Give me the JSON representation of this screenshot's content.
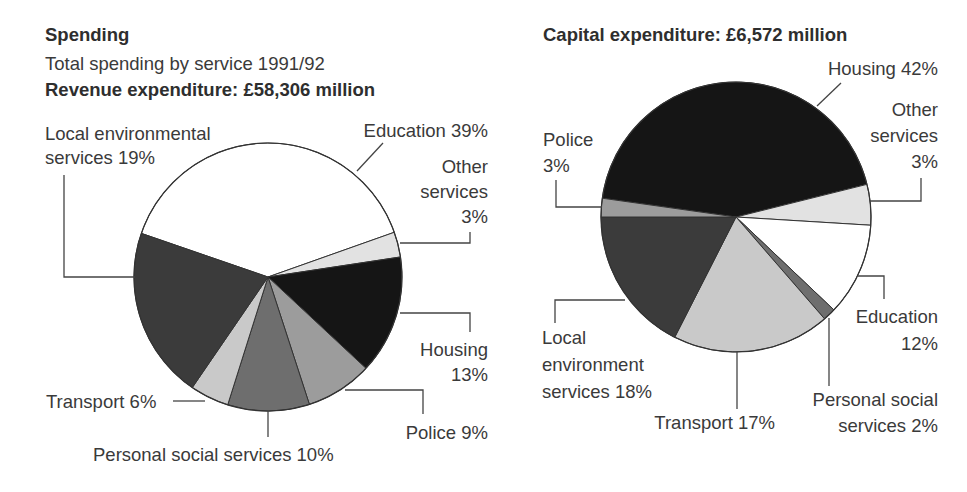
{
  "header": {
    "title": "Spending",
    "subtitle": "Total spending by service 1991/92"
  },
  "chart_data": [
    {
      "type": "pie",
      "title": "Revenue expenditure: £58,306 million",
      "center": [
        268,
        277
      ],
      "radius": 134,
      "slices": [
        {
          "name": "Education",
          "label_lines": [
            "Education 39%"
          ],
          "value": 39,
          "start": 199,
          "end": 340.5,
          "color": "#ffffff"
        },
        {
          "name": "Other services",
          "label_lines": [
            "Other",
            "services",
            "3%"
          ],
          "value": 3,
          "start": 340.5,
          "end": 351.4,
          "color": "#e2e2e2"
        },
        {
          "name": "Housing",
          "label_lines": [
            "Housing",
            "13%"
          ],
          "value": 13,
          "start": 351.4,
          "end": 403,
          "color": "#151515"
        },
        {
          "name": "Police",
          "label_lines": [
            "Police 9%"
          ],
          "value": 9,
          "start": 43,
          "end": 72,
          "color": "#9c9c9c"
        },
        {
          "name": "Personal social services",
          "label_lines": [
            "Personal social services 10%"
          ],
          "value": 10,
          "start": 72,
          "end": 107.5,
          "color": "#6e6e6e"
        },
        {
          "name": "Transport",
          "label_lines": [
            "Transport 6%"
          ],
          "value": 6,
          "start": 107.5,
          "end": 124.4,
          "color": "#c9c9c9"
        },
        {
          "name": "Local environmental services",
          "label_lines": [
            "Local environmental",
            "services 19%"
          ],
          "value": 19,
          "start": 124.4,
          "end": 199,
          "color": "#3b3b3b"
        }
      ]
    },
    {
      "type": "pie",
      "title": "Capital expenditure: £6,572 million",
      "center": [
        736,
        217
      ],
      "radius": 135,
      "slices": [
        {
          "name": "Housing",
          "label_lines": [
            "Housing 42%"
          ],
          "value": 42,
          "start": 188,
          "end": 346,
          "color": "#151515"
        },
        {
          "name": "Other services",
          "label_lines": [
            "Other",
            "services",
            "3%"
          ],
          "value": 3,
          "start": 346,
          "end": 363.5,
          "color": "#e2e2e2"
        },
        {
          "name": "Education",
          "label_lines": [
            "Education",
            "12%"
          ],
          "value": 12,
          "start": 3.5,
          "end": 43.5,
          "color": "#ffffff"
        },
        {
          "name": "Personal social services",
          "label_lines": [
            "Personal social",
            "services 2%"
          ],
          "value": 2,
          "start": 43.5,
          "end": 49,
          "color": "#6e6e6e"
        },
        {
          "name": "Transport",
          "label_lines": [
            "Transport 17%"
          ],
          "value": 17,
          "start": 49,
          "end": 117,
          "color": "#c9c9c9"
        },
        {
          "name": "Local environment services",
          "label_lines": [
            "Local",
            "environment",
            "services 18%"
          ],
          "value": 18,
          "start": 117,
          "end": 180,
          "color": "#3b3b3b"
        },
        {
          "name": "Police",
          "label_lines": [
            "Police",
            "3%"
          ],
          "value": 3,
          "start": 180,
          "end": 188,
          "color": "#9c9c9c"
        }
      ]
    }
  ],
  "labels": {
    "left": [
      {
        "slice": "Local environmental services",
        "lines": [
          "Local environmental",
          "services 19%"
        ],
        "x": 45,
        "y": [
          140,
          164
        ],
        "anchor": "start",
        "leader": [
          [
            64,
            175
          ],
          [
            64,
            277
          ],
          [
            135,
            277
          ]
        ]
      },
      {
        "slice": "Education",
        "lines": [
          "Education 39%"
        ],
        "x": 488,
        "y": [
          137
        ],
        "anchor": "end",
        "leader": [
          [
            383,
            143
          ],
          [
            357,
            171
          ]
        ]
      },
      {
        "slice": "Other services",
        "lines": [
          "Other",
          "services",
          "3%"
        ],
        "x": 488,
        "y": [
          173,
          198,
          223
        ],
        "anchor": "end",
        "leader": [
          [
            470,
            232
          ],
          [
            470,
            243
          ],
          [
            400,
            243
          ]
        ]
      },
      {
        "slice": "Housing",
        "lines": [
          "Housing",
          "13%"
        ],
        "x": 488,
        "y": [
          356,
          381
        ],
        "anchor": "end",
        "leader": [
          [
            400,
            313
          ],
          [
            470,
            313
          ],
          [
            470,
            332
          ]
        ]
      },
      {
        "slice": "Police",
        "lines": [
          "Police 9%"
        ],
        "x": 488,
        "y": [
          439
        ],
        "anchor": "end",
        "leader": [
          [
            345,
            390
          ],
          [
            423,
            390
          ],
          [
            423,
            414
          ]
        ]
      },
      {
        "slice": "Personal social services",
        "lines": [
          "Personal social services 10%"
        ],
        "x": 93,
        "y": [
          461
        ],
        "anchor": "start",
        "leader": [
          [
            268,
            411
          ],
          [
            268,
            437
          ]
        ]
      },
      {
        "slice": "Transport",
        "lines": [
          "Transport 6%"
        ],
        "x": 46,
        "y": [
          408
        ],
        "anchor": "start",
        "leader": [
          [
            173,
            401
          ],
          [
            205,
            401
          ]
        ]
      }
    ],
    "right": [
      {
        "slice": "Housing",
        "lines": [
          "Housing 42%"
        ],
        "x": 938,
        "y": [
          75
        ],
        "anchor": "end",
        "leader": [
          [
            841,
            83
          ],
          [
            817,
            106
          ]
        ]
      },
      {
        "slice": "Other services",
        "lines": [
          "Other",
          "services",
          "3%"
        ],
        "x": 938,
        "y": [
          116,
          142,
          168
        ],
        "anchor": "end",
        "leader": [
          [
            921,
            178
          ],
          [
            921,
            201
          ],
          [
            870,
            201
          ]
        ]
      },
      {
        "slice": "Police",
        "lines": [
          "Police",
          "3%"
        ],
        "x": 543,
        "y": [
          146,
          172
        ],
        "anchor": "start",
        "leader": [
          [
            556,
            180
          ],
          [
            556,
            207
          ],
          [
            602,
            207
          ]
        ]
      },
      {
        "slice": "Education",
        "lines": [
          "Education",
          "12%"
        ],
        "x": 938,
        "y": [
          323,
          350
        ],
        "anchor": "end",
        "leader": [
          [
            858,
            276
          ],
          [
            884,
            276
          ],
          [
            884,
            299
          ]
        ]
      },
      {
        "slice": "Personal social services",
        "lines": [
          "Personal social",
          "services 2%"
        ],
        "x": 938,
        "y": [
          406,
          432
        ],
        "anchor": "end",
        "leader": [
          [
            829,
            318
          ],
          [
            829,
            386
          ]
        ]
      },
      {
        "slice": "Transport",
        "lines": [
          "Transport 17%"
        ],
        "x": 775,
        "y": [
          429
        ],
        "anchor": "end",
        "leader": [
          [
            737,
            352
          ],
          [
            737,
            409
          ]
        ]
      },
      {
        "slice": "Local environment services",
        "lines": [
          "Local",
          "environment",
          "services 18%"
        ],
        "x": 542,
        "y": [
          344,
          371,
          398
        ],
        "anchor": "start",
        "leader": [
          [
            625,
            300
          ],
          [
            555,
            300
          ],
          [
            555,
            323
          ]
        ]
      }
    ]
  }
}
